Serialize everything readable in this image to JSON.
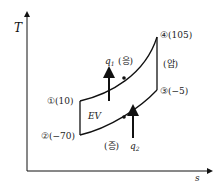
{
  "diagram": {
    "type": "T-s diagram (refrigeration cycle)",
    "axes": {
      "y_label": "T",
      "x_label": "s"
    },
    "points": [
      {
        "id": "1",
        "marker": "①",
        "label": "①(10)",
        "value": "10"
      },
      {
        "id": "2",
        "marker": "②",
        "label": "②(−70)",
        "value": "−70"
      },
      {
        "id": "3",
        "marker": "③",
        "label": "③(−5)",
        "value": "−5"
      },
      {
        "id": "4",
        "marker": "④",
        "label": "④(105)",
        "value": "105"
      }
    ],
    "processes": {
      "condensation": "(응)",
      "evaporation": "(증)",
      "compression": "(압)",
      "expansion": "EV"
    },
    "heat": {
      "q1": "q",
      "q1_sub": "1",
      "q2": "q",
      "q2_sub": "2"
    }
  }
}
